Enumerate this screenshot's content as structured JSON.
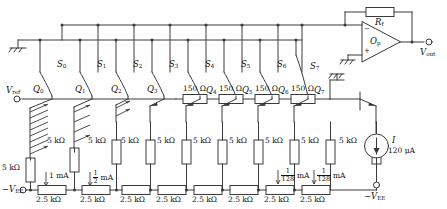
{
  "terminals": {
    "vref": "V",
    "vref_sub": "ref",
    "vout": "V",
    "vout_sub": "out",
    "vee_left": "−V",
    "vee_left_sub": "EE",
    "vee_bottom": "−V",
    "vee_bottom_sub": "EE",
    "vee_mid": "−V",
    "vee_mid_sub": "EE"
  },
  "opamp": {
    "label": "O",
    "label_sub": "p",
    "feedback_label": "R",
    "feedback_sub": "f",
    "minus": "−",
    "plus": "+"
  },
  "switches": [
    {
      "name": "S",
      "sub": "0"
    },
    {
      "name": "S",
      "sub": "1"
    },
    {
      "name": "S",
      "sub": "2"
    },
    {
      "name": "S",
      "sub": "3"
    },
    {
      "name": "S",
      "sub": "4"
    },
    {
      "name": "S",
      "sub": "5"
    },
    {
      "name": "S",
      "sub": "6"
    },
    {
      "name": "S",
      "sub": "7"
    }
  ],
  "transistors": [
    {
      "name": "Q",
      "sub": "0"
    },
    {
      "name": "Q",
      "sub": "1"
    },
    {
      "name": "Q",
      "sub": "2"
    },
    {
      "name": "Q",
      "sub": "3"
    },
    {
      "name": "Q",
      "sub": "4"
    },
    {
      "name": "Q",
      "sub": "5"
    },
    {
      "name": "Q",
      "sub": "6"
    },
    {
      "name": "Q",
      "sub": "7"
    }
  ],
  "emitter_resistors": [
    "5 kΩ",
    "5 kΩ",
    "5 kΩ",
    "5 kΩ",
    "5 kΩ",
    "5 kΩ",
    "5 kΩ",
    "5 kΩ",
    "5 kΩ",
    "5 kΩ"
  ],
  "ladder_resistors": [
    "2.5 kΩ",
    "2.5 kΩ",
    "2.5 kΩ",
    "2.5 kΩ",
    "2.5 kΩ",
    "2.5 kΩ",
    "2.5 kΩ",
    "2.5 kΩ"
  ],
  "base_resistors": [
    "150 Ω",
    "150 Ω",
    "150 Ω",
    "150 Ω",
    "150 Ω"
  ],
  "currents": [
    {
      "whole": "1",
      "num": "",
      "den": "",
      "unit": "mA"
    },
    {
      "whole": "",
      "num": "1",
      "den": "2",
      "unit": "mA"
    },
    {
      "whole": "",
      "num": "1",
      "den": "128",
      "unit": "mA"
    },
    {
      "whole": "",
      "num": "1",
      "den": "128",
      "unit": "mA"
    }
  ],
  "current_source": {
    "symbol": "I",
    "value": "120 μA"
  },
  "colors": {
    "line": "#3a3a3a",
    "text": "#111111",
    "fill": "#ffffff"
  }
}
